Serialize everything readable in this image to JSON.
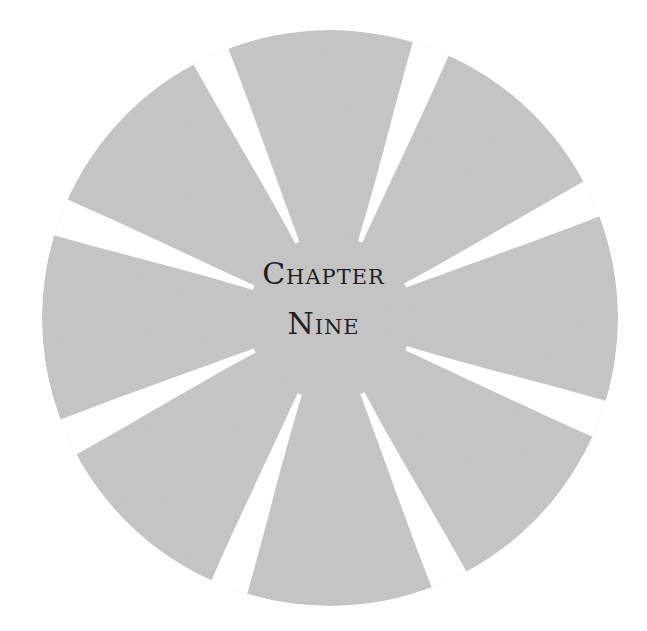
{
  "heading": {
    "line1": "Chapter",
    "line2": "Nine"
  },
  "emblem": {
    "shape": "swirl-circle",
    "fill_color": "#c9c9c9",
    "slit_color": "#ffffff",
    "slit_count": 8
  }
}
